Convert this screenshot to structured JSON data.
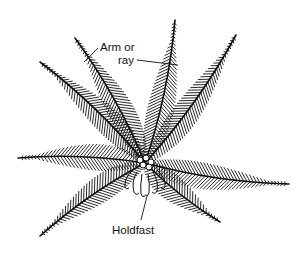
{
  "figure": {
    "background": "#ffffff",
    "ink": "#111111",
    "center": [
      145,
      163
    ],
    "arms": [
      {
        "id": "arm-upper-left-inner",
        "tip": [
          75,
          38
        ]
      },
      {
        "id": "arm-upper-left-outer",
        "tip": [
          40,
          62
        ]
      },
      {
        "id": "arm-upper-right-inner",
        "tip": [
          175,
          20
        ]
      },
      {
        "id": "arm-upper-right-outer",
        "tip": [
          236,
          35
        ]
      },
      {
        "id": "arm-left",
        "tip": [
          18,
          158
        ]
      },
      {
        "id": "arm-right",
        "tip": [
          289,
          184
        ]
      },
      {
        "id": "arm-lower-left",
        "tip": [
          40,
          236
        ]
      },
      {
        "id": "arm-lower-right",
        "tip": [
          220,
          222
        ]
      }
    ]
  },
  "labels": {
    "arm_line1": "Arm or",
    "arm_line2": "ray",
    "holdfast": "Holdfast"
  }
}
